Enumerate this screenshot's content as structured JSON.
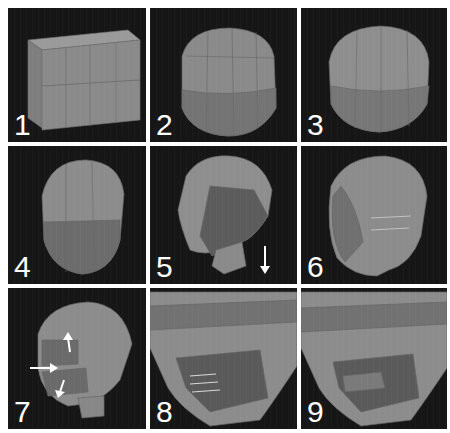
{
  "figure": {
    "panels": [
      {
        "label": "1",
        "content": "subdivided cube"
      },
      {
        "label": "2",
        "content": "rounded cube"
      },
      {
        "label": "3",
        "content": "sphere-like head base"
      },
      {
        "label": "4",
        "content": "head shape with narrowed jaw"
      },
      {
        "label": "5",
        "content": "neck extruded",
        "arrows": [
          "down"
        ]
      },
      {
        "label": "6",
        "content": "side view with edge loops"
      },
      {
        "label": "7",
        "content": "mouth area extrusion",
        "arrows": [
          "up",
          "right",
          "down"
        ]
      },
      {
        "label": "8",
        "content": "close-up mouth cavity with edge lines"
      },
      {
        "label": "9",
        "content": "close-up mouth refined"
      }
    ]
  },
  "colors": {
    "background": "#161616",
    "mesh": "#8a8a8a",
    "mesh_dark": "#5e5e5e",
    "mesh_light": "#a4a4a4",
    "label": "#ffffff",
    "arrow": "#ffffff"
  }
}
